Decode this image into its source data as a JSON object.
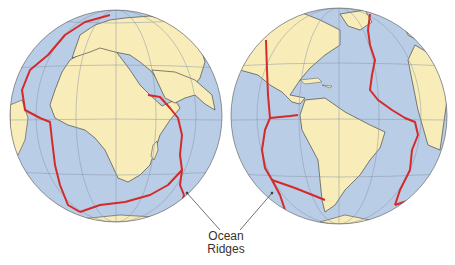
{
  "figure": {
    "label_line1": "Ocean",
    "label_line2": "Ridges",
    "globes": [
      {
        "name": "eastern-hemisphere-globe",
        "regions": [
          "Africa",
          "Europe",
          "Arabia",
          "Madagascar",
          "South America (edge)"
        ]
      },
      {
        "name": "western-hemisphere-globe",
        "regions": [
          "North America",
          "South America",
          "Caribbean",
          "Greenland",
          "Africa (edge)",
          "Europe (edge)"
        ]
      }
    ],
    "colors": {
      "ocean": "#b9cde6",
      "land": "#f8ecb8",
      "ridge": "#d42a2a",
      "grid": "#8a97a8",
      "coast": "#333333",
      "leader": "#333333"
    }
  }
}
